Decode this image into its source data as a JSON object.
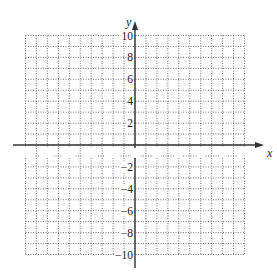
{
  "chart_data": {
    "type": "scatter",
    "title": "",
    "xlabel": "x",
    "ylabel": "y",
    "xlim": [
      -10,
      10
    ],
    "ylim": [
      -10,
      10
    ],
    "grid": true,
    "grid_style": "dotted",
    "grid_step": 1,
    "x_ticks": [
      -10,
      -8,
      -6,
      -4,
      -2,
      0,
      2,
      4,
      6,
      8,
      10
    ],
    "y_ticks": [
      -10,
      -8,
      -6,
      -4,
      -2,
      2,
      4,
      6,
      8,
      10
    ],
    "x_tick_labels": [
      "−10",
      "−8",
      "−6",
      "−4",
      "−2",
      "0",
      "2",
      "4",
      "6",
      "8",
      "10"
    ],
    "y_tick_labels": [
      "−10",
      "−8",
      "−6",
      "−4",
      "−2",
      "2",
      "4",
      "6",
      "8",
      "10"
    ],
    "series": [],
    "legend": null
  },
  "colors": {
    "axis": "#333333",
    "grid": "#555555",
    "text": "#222222",
    "background": "#ffffff"
  }
}
